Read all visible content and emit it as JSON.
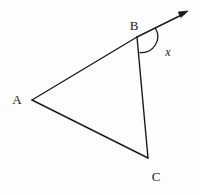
{
  "figure": {
    "background_color": "#fdfdfd",
    "stroke_color": "#1a1a1a",
    "stroke_width": 1.4,
    "width": 200,
    "height": 195,
    "points": {
      "A": {
        "x": 32,
        "y": 100
      },
      "B": {
        "x": 137,
        "y": 37
      },
      "C": {
        "x": 148,
        "y": 158
      },
      "ray_tip": {
        "x": 188,
        "y": 11
      }
    },
    "segments": [
      {
        "name": "AB",
        "from": "A",
        "to": "B"
      },
      {
        "name": "AC",
        "from": "A",
        "to": "C"
      },
      {
        "name": "BC",
        "from": "B",
        "to": "C"
      },
      {
        "name": "B-ray",
        "from": "B",
        "to": "ray_tip",
        "arrow": true
      }
    ],
    "labels": [
      {
        "id": "A",
        "text": "A",
        "x": 17,
        "y": 99
      },
      {
        "id": "B",
        "text": "B",
        "x": 134,
        "y": 25
      },
      {
        "id": "C",
        "text": "C",
        "x": 156,
        "y": 176
      }
    ],
    "angle_marks": [
      {
        "id": "x",
        "text": "x",
        "at_vertex": "B",
        "label_x": 168,
        "label_y": 52,
        "arc_start": {
          "x": 155.5,
          "y": 28.5
        },
        "arc_end": {
          "x": 140.0,
          "y": 52.5
        },
        "arc_radius": 16,
        "italic": true
      }
    ],
    "arrow_head": {
      "name": "ray-arrowhead",
      "length": 9,
      "half_width": 3.6
    }
  }
}
